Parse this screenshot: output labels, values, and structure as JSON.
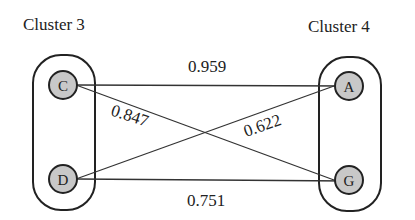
{
  "clusters": [
    {
      "title": "Cluster 3",
      "nodes": [
        "C",
        "D"
      ]
    },
    {
      "title": "Cluster 4",
      "nodes": [
        "A",
        "G"
      ]
    }
  ],
  "edges": [
    {
      "from": "C",
      "to": "A",
      "weight": "0.959"
    },
    {
      "from": "C",
      "to": "G",
      "weight": "0.847"
    },
    {
      "from": "D",
      "to": "A",
      "weight": "0.622"
    },
    {
      "from": "D",
      "to": "G",
      "weight": "0.751"
    }
  ],
  "colors": {
    "node_fill": "#c8c8c8",
    "stroke": "#222222"
  }
}
